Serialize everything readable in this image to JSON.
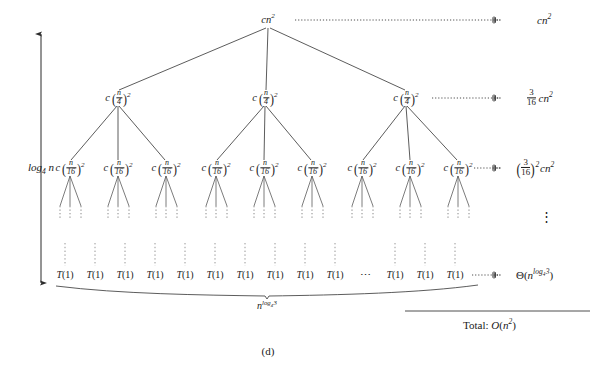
{
  "figure": {
    "caption": "(d)",
    "type": "recursion-tree",
    "total_label_prefix": "Total:",
    "total_value": "O(n^2)",
    "total_display": "Total: O(n²)"
  },
  "depth_axis": {
    "label_display": "log_4 n",
    "label_base": "log",
    "label_sub": "4",
    "label_var": "n",
    "arrow_style": "double-headed-vertical",
    "x": 41,
    "y_top": 34,
    "y_bottom": 283
  },
  "levels": [
    {
      "index": 0,
      "node_label": "cn²",
      "node_count": 1,
      "cost_label": "cn²",
      "y": 20,
      "nodes_x": [
        268
      ]
    },
    {
      "index": 1,
      "node_label": "c(n/4)²",
      "node_count": 3,
      "cost_label": "(3/16)cn²",
      "y": 98,
      "nodes_x": [
        118,
        265,
        406
      ]
    },
    {
      "index": 2,
      "node_label": "c(n/16)²",
      "node_count": 9,
      "cost_label": "(3/16)²cn²",
      "y": 168,
      "nodes_x": [
        70,
        118,
        166,
        216,
        264,
        312,
        362,
        410,
        458
      ]
    },
    {
      "index": 3,
      "node_label": "T(1)",
      "node_count": 13,
      "cost_label": "Θ(n^{log_4 3})",
      "y": 275,
      "nodes_x": [
        65,
        95,
        125,
        155,
        185,
        215,
        245,
        275,
        305,
        335,
        395,
        425,
        455
      ]
    }
  ],
  "ellipsis": {
    "horizontal_leaf_gap": "⋯",
    "horizontal_x": 365,
    "horizontal_y": 275,
    "vertical_between_costs": "⋮",
    "vertical_x": 546,
    "vertical_y": 216
  },
  "cost_column": {
    "x": 523,
    "leader_end_x": 508,
    "rows": [
      {
        "y": 20,
        "leader_from_x": 295,
        "text_parts": {
          "c": "c",
          "n": "n",
          "exp": "2"
        }
      },
      {
        "y": 98,
        "leader_from_x": 430,
        "frac_num": "3",
        "frac_den": "16",
        "c": "c",
        "n": "n",
        "exp": "2"
      },
      {
        "y": 168,
        "leader_from_x": 470,
        "frac_num": "3",
        "frac_den": "16",
        "outer_exp": "2",
        "c": "c",
        "n": "n",
        "exp": "2"
      },
      {
        "y": 275,
        "leader_from_x": 470,
        "theta": "Θ",
        "n": "n",
        "exp_log": "log",
        "exp_sub": "4",
        "exp_arg": "3"
      }
    ]
  },
  "brace": {
    "label_n": "n",
    "label_log": "log",
    "label_sub": "4",
    "label_arg": "3",
    "label_display": "n^{log_4 3}",
    "x_left": 56,
    "x_right": 478,
    "x_center": 267,
    "y": 290,
    "label_y": 301
  },
  "total_rule": {
    "x1": 405,
    "x2": 590,
    "y": 311
  },
  "total_text": {
    "x": 463,
    "y": 327,
    "prefix": "Total:",
    "value_o": "O",
    "value_n": "n",
    "value_exp": "2"
  },
  "colors": {
    "ink": "#1a1a1a",
    "edge": "#4a4a4a",
    "dotted": "#6b6b6b",
    "background": "#ffffff"
  }
}
